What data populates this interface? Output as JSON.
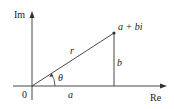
{
  "diagram": {
    "axes": {
      "vertical_label": "Im",
      "horizontal_label": "Re",
      "origin_label": "0"
    },
    "point_label": "a + bi",
    "segments": {
      "radius_label": "r",
      "horizontal_label": "a",
      "vertical_label": "b",
      "angle_label": "θ"
    },
    "colors": {
      "line": "#333333",
      "text": "#1a1a1a",
      "background": "#ffffff"
    }
  }
}
